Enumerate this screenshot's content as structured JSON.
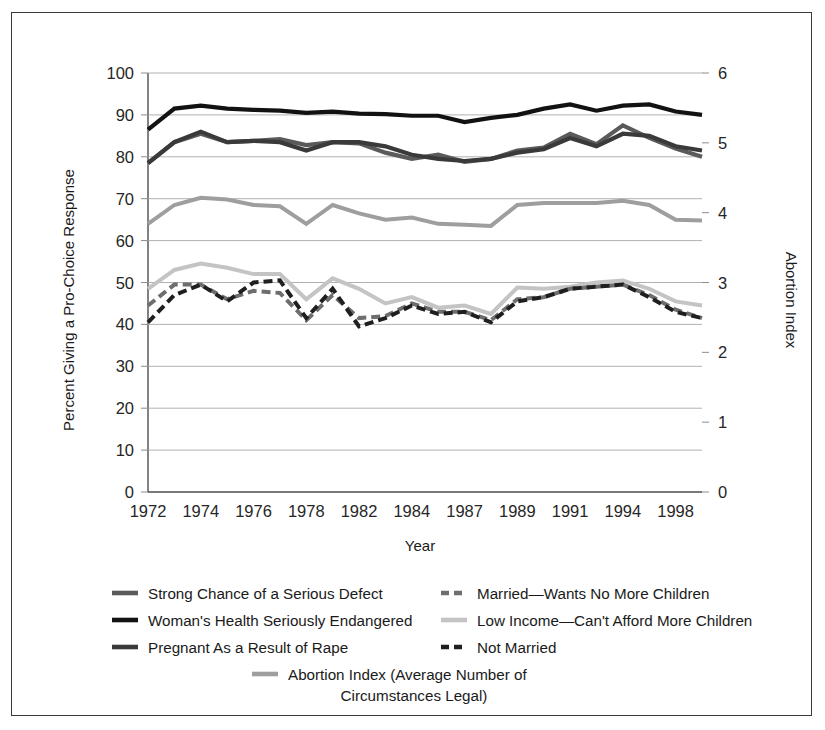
{
  "chart_data": {
    "type": "line",
    "title": "",
    "xlabel": "Year",
    "ylabel": "Percent Giving a Pro-Choice Response",
    "y2label": "Abortion Index",
    "ylim": [
      0,
      100
    ],
    "y2lim": [
      0,
      6
    ],
    "grid": true,
    "legend_position": "bottom",
    "x": [
      1972,
      1973,
      1974,
      1975,
      1976,
      1977,
      1978,
      1980,
      1982,
      1983,
      1984,
      1985,
      1987,
      1988,
      1989,
      1990,
      1991,
      1993,
      1994,
      1996,
      1998,
      2000
    ],
    "xtick_labels": [
      "1972",
      "",
      "1974",
      "",
      "1976",
      "",
      "1978",
      "",
      "1982",
      "",
      "1984",
      "",
      "1987",
      "",
      "1989",
      "",
      "1991",
      "",
      "1994",
      "",
      "1998",
      ""
    ],
    "ytick_labels": [
      "0",
      "10",
      "20",
      "30",
      "40",
      "50",
      "60",
      "70",
      "80",
      "90",
      "100"
    ],
    "y2tick_labels": [
      "0",
      "1",
      "2",
      "3",
      "4",
      "5",
      "6"
    ],
    "series": [
      {
        "name": "Woman's Health Seriously Endangered",
        "color": "#121212",
        "dash": "solid",
        "width": 4.2,
        "axis": "left",
        "values": [
          86.5,
          91.5,
          92.2,
          91.5,
          91.2,
          91.0,
          90.5,
          90.8,
          90.3,
          90.2,
          89.8,
          89.8,
          88.3,
          89.3,
          90.0,
          91.5,
          92.5,
          91.0,
          92.2,
          92.5,
          90.8,
          90.0
        ]
      },
      {
        "name": "Strong Chance of a Serious Defect",
        "color": "#5a5a5a",
        "dash": "solid",
        "width": 4.2,
        "axis": "left",
        "values": [
          78.5,
          83.5,
          85.5,
          83.5,
          83.8,
          84.2,
          82.8,
          83.5,
          83.2,
          81.0,
          79.5,
          80.5,
          78.8,
          79.5,
          81.5,
          82.2,
          85.5,
          83.0,
          87.5,
          84.5,
          82.0,
          80.0
        ]
      },
      {
        "name": "Pregnant As a Result of Rape",
        "color": "#3a3a3a",
        "dash": "solid",
        "width": 4.2,
        "axis": "left",
        "values": [
          78.5,
          83.5,
          86.0,
          83.5,
          83.8,
          83.5,
          81.5,
          83.5,
          83.5,
          82.5,
          80.5,
          79.5,
          79.0,
          79.5,
          81.0,
          81.8,
          84.5,
          82.5,
          85.5,
          85.0,
          82.5,
          81.5
        ]
      },
      {
        "name": "Abortion Index (Average Number of Circumstances Legal)",
        "color": "#9e9e9e",
        "dash": "solid",
        "width": 4.0,
        "axis": "right",
        "values": [
          64.0,
          68.5,
          70.2,
          69.8,
          68.5,
          68.2,
          64.0,
          68.5,
          66.5,
          65.0,
          65.5,
          64.0,
          63.8,
          63.5,
          68.5,
          69.0,
          69.0,
          69.0,
          69.5,
          68.5,
          65.0,
          64.8
        ]
      },
      {
        "name": "Low Income—Can't Afford More Children",
        "color": "#c4c4c4",
        "dash": "solid",
        "width": 4.0,
        "axis": "left",
        "values": [
          48.5,
          53.0,
          54.5,
          53.5,
          52.0,
          52.0,
          46.0,
          51.0,
          48.5,
          45.0,
          46.5,
          44.0,
          44.5,
          42.5,
          48.8,
          48.5,
          49.0,
          50.0,
          50.5,
          48.5,
          45.5,
          44.5
        ]
      },
      {
        "name": "Married—Wants No More Children",
        "color": "#6e6e6e",
        "dash": "dashed",
        "width": 4.0,
        "axis": "left",
        "values": [
          44.5,
          49.5,
          49.5,
          46.0,
          48.0,
          47.5,
          41.0,
          47.0,
          41.5,
          42.0,
          45.0,
          43.0,
          43.0,
          41.0,
          46.0,
          46.5,
          48.5,
          49.0,
          49.5,
          47.0,
          43.5,
          41.5
        ]
      },
      {
        "name": "Not Married",
        "color": "#1f1f1f",
        "dash": "dashed",
        "width": 4.0,
        "axis": "left",
        "values": [
          40.5,
          47.0,
          49.5,
          45.5,
          50.0,
          50.5,
          41.5,
          48.5,
          39.5,
          41.5,
          44.5,
          42.5,
          43.0,
          40.5,
          45.5,
          46.5,
          48.5,
          49.0,
          49.5,
          46.5,
          43.0,
          41.5
        ]
      }
    ]
  },
  "axes": {
    "y_left_title": "Percent Giving a Pro-Choice Response",
    "y_right_title": "Abortion Index",
    "x_title": "Year"
  },
  "legend": {
    "col1": [
      {
        "label": "Strong Chance of a Serious Defect",
        "color": "#5a5a5a",
        "dash": "solid"
      },
      {
        "label": "Woman's Health Seriously Endangered",
        "color": "#121212",
        "dash": "solid"
      },
      {
        "label": "Pregnant As a Result of Rape",
        "color": "#3a3a3a",
        "dash": "solid"
      }
    ],
    "col2": [
      {
        "label": "Married—Wants No More Children",
        "color": "#6e6e6e",
        "dash": "dashed"
      },
      {
        "label": "Low Income—Can't Afford More Children",
        "color": "#c4c4c4",
        "dash": "solid"
      },
      {
        "label": "Not Married",
        "color": "#1f1f1f",
        "dash": "dashed"
      }
    ],
    "center": {
      "label_line1": "Abortion Index (Average Number of",
      "label_line2": "Circumstances Legal)",
      "color": "#9e9e9e",
      "dash": "solid"
    }
  }
}
